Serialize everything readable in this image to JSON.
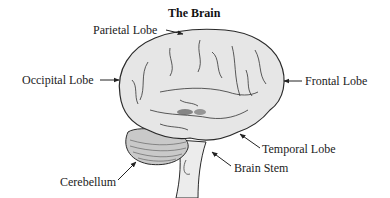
{
  "diagram": {
    "title": "The Brain",
    "labels": {
      "parietal": "Parietal Lobe",
      "occipital": "Occipital Lobe",
      "frontal": "Frontal Lobe",
      "temporal": "Temporal Lobe",
      "brain_stem": "Brain Stem",
      "cerebellum": "Cerebellum"
    },
    "colors": {
      "brain_fill": "#e6e6e6",
      "outline": "#2a2a2a",
      "cerebellum_fill": "#c9c9c9",
      "stem_fill": "#ececec"
    }
  }
}
